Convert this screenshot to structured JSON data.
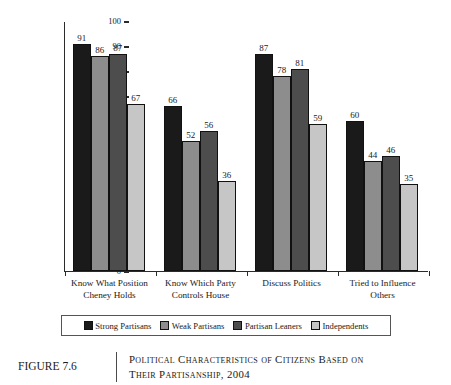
{
  "figure": {
    "number_label": "FIGURE 7.6",
    "caption_line1": "Political Characteristics of Citizens Based on",
    "caption_line2": "Their Partisanship, 2004"
  },
  "axis": {
    "y_title": "Percent",
    "y_ticks": [
      "100",
      "90",
      "80",
      "70",
      "60",
      "50",
      "40",
      "30",
      "20",
      "10",
      "0"
    ]
  },
  "legend": {
    "items": [
      {
        "label": "Strong Partisans",
        "color": "#1a1a1a"
      },
      {
        "label": "Weak Partisans",
        "color": "#8d8d8d"
      },
      {
        "label": "Partisan Leaners",
        "color": "#4d4d4d"
      },
      {
        "label": "Independents",
        "color": "#c6c6c6"
      }
    ]
  },
  "chart_data": {
    "type": "bar",
    "title": "Political Characteristics of Citizens Based on Their Partisanship, 2004",
    "xlabel": "",
    "ylabel": "Percent",
    "ylim": [
      0,
      100
    ],
    "ytick_step": 10,
    "grid": false,
    "legend_position": "bottom",
    "categories": [
      "Know What Position Cheney Holds",
      "Know Which Party Controls House",
      "Discuss Politics",
      "Tried to Influence Others"
    ],
    "category_lines": [
      [
        "Know What Position",
        "Cheney Holds"
      ],
      [
        "Know Which Party",
        "Controls House"
      ],
      [
        "Discuss Politics",
        ""
      ],
      [
        "Tried to Influence",
        "Others"
      ]
    ],
    "series": [
      {
        "name": "Strong Partisans",
        "color": "#1a1a1a",
        "values": [
          91,
          66,
          87,
          60
        ]
      },
      {
        "name": "Weak Partisans",
        "color": "#8d8d8d",
        "values": [
          86,
          52,
          78,
          44
        ]
      },
      {
        "name": "Partisan Leaners",
        "color": "#4d4d4d",
        "values": [
          87,
          56,
          81,
          46
        ]
      },
      {
        "name": "Independents",
        "color": "#c6c6c6",
        "values": [
          67,
          36,
          59,
          35
        ]
      }
    ],
    "data_labels": true
  }
}
